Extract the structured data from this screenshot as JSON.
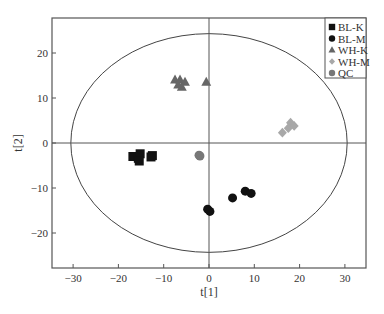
{
  "chart_data": {
    "type": "scatter",
    "title": "",
    "xlabel": "t[1]",
    "ylabel": "t[2]",
    "xlim": [
      -35,
      35
    ],
    "ylim": [
      -28,
      27
    ],
    "xticks": [
      -30,
      -20,
      -10,
      0,
      10,
      20,
      30
    ],
    "yticks": [
      -20,
      -10,
      0,
      10,
      20
    ],
    "grid": false,
    "legend_position": "top-right",
    "reference_lines": {
      "x": 0,
      "y": 0
    },
    "confidence_ellipse": {
      "cx": 0,
      "cy": 0,
      "rx": 30.5,
      "ry": 24.3
    },
    "series": [
      {
        "name": "BL-K",
        "marker": "square",
        "color": "#111111",
        "points": [
          [
            -16.8,
            -3.0
          ],
          [
            -15.6,
            -3.4
          ],
          [
            -15.2,
            -2.4
          ],
          [
            -15.4,
            -4.0
          ],
          [
            -12.5,
            -2.8
          ],
          [
            -12.8,
            -3.1
          ]
        ]
      },
      {
        "name": "BL-M",
        "marker": "circle",
        "color": "#111111",
        "points": [
          [
            -0.3,
            -14.7
          ],
          [
            0.2,
            -15.2
          ],
          [
            5.2,
            -12.2
          ],
          [
            8.0,
            -10.7
          ],
          [
            9.3,
            -11.2
          ]
        ]
      },
      {
        "name": "WH-K",
        "marker": "triangle",
        "color": "#666666",
        "points": [
          [
            -7.5,
            14.0
          ],
          [
            -6.4,
            14.0
          ],
          [
            -5.3,
            13.5
          ],
          [
            -6.0,
            12.4
          ],
          [
            -6.8,
            12.9
          ],
          [
            -0.6,
            13.5
          ]
        ]
      },
      {
        "name": "WH-M",
        "marker": "diamond",
        "color": "#a8a8a8",
        "points": [
          [
            18.0,
            4.5
          ],
          [
            18.8,
            3.8
          ],
          [
            17.5,
            3.3
          ],
          [
            16.2,
            2.3
          ]
        ]
      },
      {
        "name": "QC",
        "marker": "circle",
        "color": "#777777",
        "points": [
          [
            -2.2,
            -2.7
          ],
          [
            -2.0,
            -2.9
          ]
        ]
      }
    ]
  }
}
